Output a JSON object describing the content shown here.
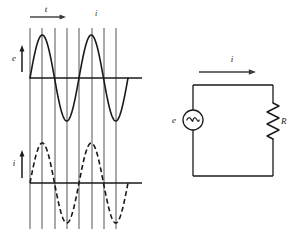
{
  "figure": {
    "background": "#ffffff",
    "ink_color": "#1a1a1a",
    "grid_color": "#555555"
  },
  "waveform_panel": {
    "time_axis": {
      "label": "t",
      "arrow_direction": "right",
      "arrow_x_start": 30,
      "arrow_x_end": 66,
      "arrow_y": 17
    },
    "marker_label": {
      "text": "i",
      "x": 96,
      "y": 16
    },
    "gridlines": {
      "count": 8,
      "x_positions": [
        30,
        42,
        55,
        67,
        79,
        92,
        104,
        116
      ],
      "y_top": 28,
      "y_bottom": 229,
      "color": "#555555"
    },
    "voltage_plot": {
      "y_label": "e",
      "y_label_x": 14,
      "y_label_y": 61,
      "y_arrow_x": 22,
      "y_arrow_top": 45,
      "y_arrow_bottom": 72,
      "baseline_y": 78,
      "baseline_x_start": 30,
      "baseline_x_end": 142,
      "amplitude": 43,
      "wave_x_start": 30,
      "wave_x_end": 128,
      "cycles": 2,
      "line_style": "solid",
      "line_width": 1.6,
      "phase_deg": 0
    },
    "current_plot": {
      "y_label": "i",
      "y_label_x": 14,
      "y_label_y": 166,
      "y_arrow_x": 22,
      "y_arrow_top": 150,
      "y_arrow_bottom": 178,
      "baseline_y": 183,
      "baseline_x_start": 30,
      "baseline_x_end": 142,
      "amplitude": 40,
      "wave_x_start": 30,
      "wave_x_end": 128,
      "cycles": 2,
      "line_style": "dashed",
      "dash_pattern": "5,3",
      "line_width": 1.6,
      "phase_deg": 0
    }
  },
  "circuit_panel": {
    "current_arrow": {
      "label": "i",
      "label_x": 232,
      "label_y": 62,
      "arrow_x_start": 199,
      "arrow_x_end": 256,
      "arrow_y": 72
    },
    "loop": {
      "left_x": 193,
      "right_x": 273,
      "top_y": 85,
      "bottom_y": 176
    },
    "source": {
      "label": "e",
      "label_x": 174,
      "label_y": 123,
      "symbol": "ac-source-tilde",
      "center_x": 193,
      "center_y": 120,
      "radius": 10,
      "glyph": "~"
    },
    "resistor": {
      "label": "R",
      "label_x": 281,
      "label_y": 124,
      "symbol": "zigzag-resistor",
      "center_x": 273,
      "top_y": 103,
      "bottom_y": 139,
      "zig_width": 6,
      "segments": 6
    }
  }
}
